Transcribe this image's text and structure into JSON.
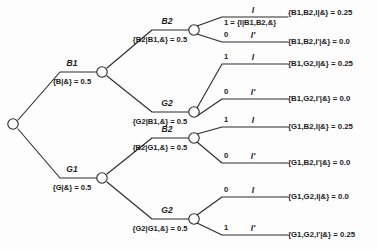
{
  "diagram": {
    "stroke_color": "#2a2a2a",
    "node_fill": "#ffffff",
    "background": "#fdfdfd"
  },
  "root": {
    "node_name": "root-node"
  },
  "level1": [
    {
      "name": "B1",
      "expr": "{B|&} = 0.5",
      "prob": 0.5
    },
    {
      "name": "G1",
      "expr": "{G|&} = 0.5",
      "prob": 0.5
    }
  ],
  "level2": [
    {
      "name": "B2",
      "expr": "{B2|B1,&} = 0.5",
      "prob": 0.5
    },
    {
      "name": "G2",
      "expr": "{G2|B1,&} = 0.5",
      "prob": 0.5
    },
    {
      "name": "B2",
      "expr": "{B2|G1,&} = 0.5",
      "prob": 0.5
    },
    {
      "name": "G2",
      "expr": "{G2|G1,&} = 0.5",
      "prob": 0.5
    }
  ],
  "level3": [
    {
      "name": "I",
      "value": "1 = {I|B1,B2,&}"
    },
    {
      "name": "I'",
      "value": "0"
    },
    {
      "name": "I",
      "value": "1"
    },
    {
      "name": "I'",
      "value": "0"
    },
    {
      "name": "I",
      "value": "1"
    },
    {
      "name": "I'",
      "value": "0"
    },
    {
      "name": "I",
      "value": "0"
    },
    {
      "name": "I'",
      "value": "1"
    }
  ],
  "leaves": [
    {
      "text": "{B1,B2,I|&} = 0.25",
      "prob": 0.25
    },
    {
      "text": "{B1,B2,I'|&} = 0.0",
      "prob": 0.0
    },
    {
      "text": "{B1,G2,I|&} = 0.25",
      "prob": 0.25
    },
    {
      "text": "{B1,G2,I'|&} = 0.0",
      "prob": 0.0
    },
    {
      "text": "{G1,B2,I|&} = 0.25",
      "prob": 0.25
    },
    {
      "text": "{G1,B2,I'|&} = 0.0",
      "prob": 0.0
    },
    {
      "text": "{G1,G2,I|&} = 0.0",
      "prob": 0.0
    },
    {
      "text": "{G1,G2,I'|&} = 0.25",
      "prob": 0.25
    }
  ]
}
